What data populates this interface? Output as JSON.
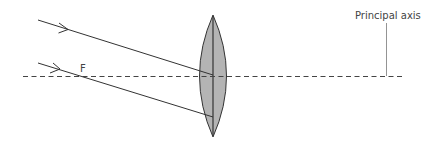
{
  "diagram": {
    "type": "optics-ray-diagram",
    "labels": {
      "principal_axis": "Principal axis",
      "focal_point": "F"
    },
    "lens": {
      "type": "convex-lens",
      "fill": "#b4b4b4",
      "stroke": "#333333"
    },
    "rays": [
      {
        "name": "upper-ray",
        "direction": "right"
      },
      {
        "name": "lower-ray-through-F",
        "direction": "right"
      }
    ],
    "colors": {
      "ray": "#333333",
      "axis": "#444444",
      "leader": "#888888",
      "text": "#444444"
    }
  }
}
